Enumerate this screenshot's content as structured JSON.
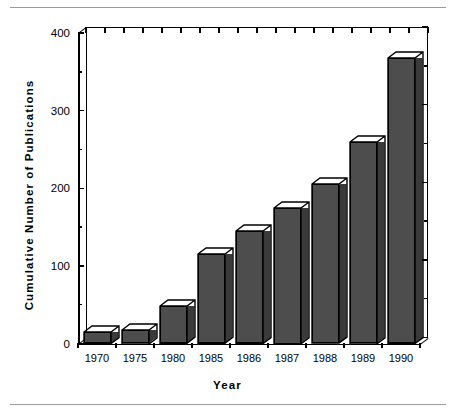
{
  "chart_data": {
    "type": "bar",
    "title": "",
    "subtitle": "",
    "xlabel": "Year",
    "ylabel": "Cumulative Number of Publications",
    "categories": [
      "1970",
      "1975",
      "1980",
      "1985",
      "1986",
      "1987",
      "1988",
      "1989",
      "1990"
    ],
    "values": [
      15,
      18,
      48,
      115,
      145,
      175,
      205,
      260,
      368
    ],
    "series": [
      {
        "name": "Cumulative Number of Publications",
        "values": [
          15,
          18,
          48,
          115,
          145,
          175,
          205,
          260,
          368
        ]
      }
    ],
    "ylim": [
      0,
      400
    ],
    "y_major_ticks": [
      0,
      100,
      200,
      300,
      400
    ],
    "y_minor_ticks": [
      50,
      150,
      250,
      350
    ],
    "y_tick_labels": [
      "0",
      "100",
      "200",
      "300",
      "400"
    ],
    "grid": false,
    "legend": null,
    "legend_position": "none",
    "style": "3d-bar",
    "bar_face_color": "#4d4d4d",
    "bar_top_color": "#ffffff",
    "bar_side_color": "#3a3a3a",
    "bar_edge_color": "#000000",
    "axis_color": "#000000",
    "background_color": "#ffffff",
    "rule_color": "#9a9a9a",
    "annotations": []
  },
  "figure": {
    "top_rule": "",
    "bottom_rule": ""
  }
}
